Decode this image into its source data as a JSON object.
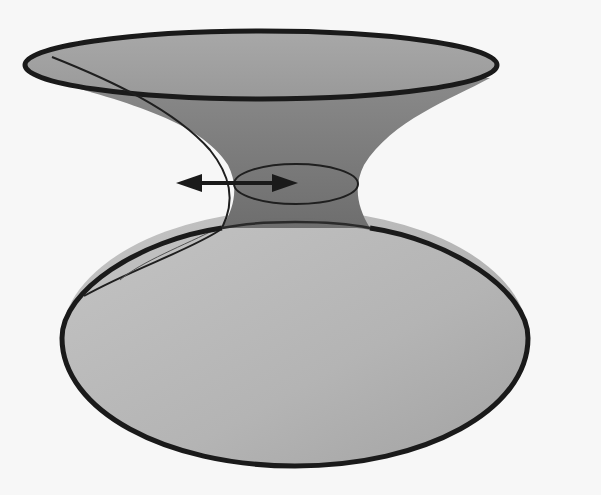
{
  "figure": {
    "type": "diagram",
    "colors": {
      "background": "#f7f7f7",
      "upper_surface": "#8f8f8f",
      "upper_rim_fill": "#a9a9a9",
      "throat": "#7a7a7a",
      "lower_surface": "#b8b8b8",
      "outline": "#1a1a1a"
    },
    "elements": [
      {
        "name": "top-rim-ellipse",
        "cx": 261,
        "cy": 65,
        "rx": 236,
        "ry": 34
      },
      {
        "name": "throat-ellipse",
        "cx": 296,
        "cy": 184,
        "rx": 62,
        "ry": 20
      },
      {
        "name": "bottom-rim-ellipse",
        "cx": 295,
        "cy": 338,
        "rx": 233,
        "ry": 128
      },
      {
        "name": "double-arrow",
        "x1": 176,
        "y1": 183,
        "x2": 298,
        "y2": 183
      },
      {
        "name": "seam-curve",
        "description": "geodesic line running from upper-left rim down through throat to lower-left"
      }
    ],
    "labels": []
  }
}
